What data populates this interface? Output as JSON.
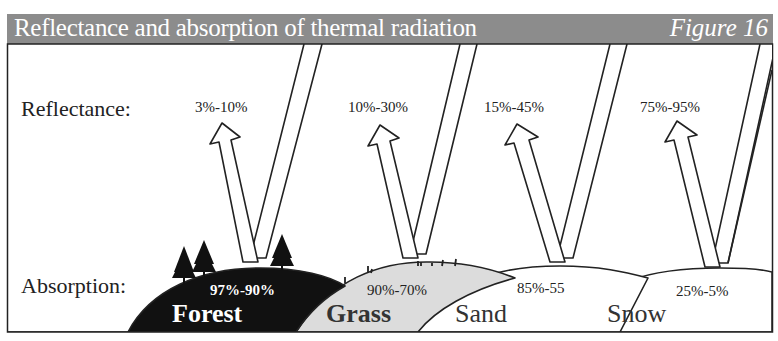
{
  "header": {
    "title": "Reflectance and absorption of thermal radiation",
    "figure_label": "Figure 16"
  },
  "row_labels": {
    "reflectance": "Reflectance:",
    "absorption": "Absorption:"
  },
  "surfaces": [
    {
      "name": "Forest",
      "reflectance": "3%-10%",
      "absorption": "97%-90%",
      "fill": "#111111",
      "text_color": "#ffffff"
    },
    {
      "name": "Grass",
      "reflectance": "10%-30%",
      "absorption": "90%-70%",
      "fill": "#dcdcdc",
      "text_color": "#333333"
    },
    {
      "name": "Sand",
      "reflectance": "15%-45%",
      "absorption": "85%-55",
      "fill": "#ffffff",
      "text_color": "#333333"
    },
    {
      "name": "Snow",
      "reflectance": "75%-95%",
      "absorption": "25%-5%",
      "fill": "#ffffff",
      "text_color": "#333333"
    }
  ],
  "colors": {
    "header_bg": "#8c8c8c",
    "stroke": "#222222"
  }
}
